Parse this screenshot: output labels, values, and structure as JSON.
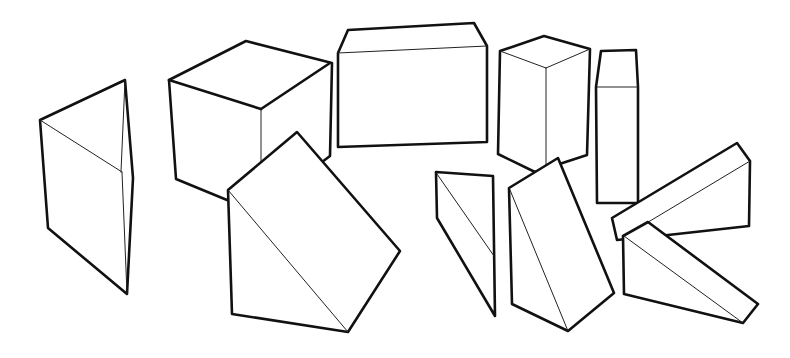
{
  "drawing": {
    "description": "Line drawing of geometric solids (prisms and blocks)",
    "stroke_color": "#111111",
    "background": "#ffffff",
    "shapes": [
      {
        "name": "triangular-prism-left",
        "kind": "triangular prism"
      },
      {
        "name": "cube",
        "kind": "cube"
      },
      {
        "name": "rectangular-block-wide",
        "kind": "rectangular block"
      },
      {
        "name": "rectangular-block-tall",
        "kind": "rectangular block"
      },
      {
        "name": "tall-column",
        "kind": "rectangular column"
      },
      {
        "name": "wedge-large",
        "kind": "triangular prism"
      },
      {
        "name": "wedge-small",
        "kind": "triangular prism"
      },
      {
        "name": "wedge-leaning",
        "kind": "triangular prism"
      },
      {
        "name": "wedge-lying-back",
        "kind": "triangular prism"
      },
      {
        "name": "wedge-lying-front",
        "kind": "triangular prism"
      }
    ]
  }
}
